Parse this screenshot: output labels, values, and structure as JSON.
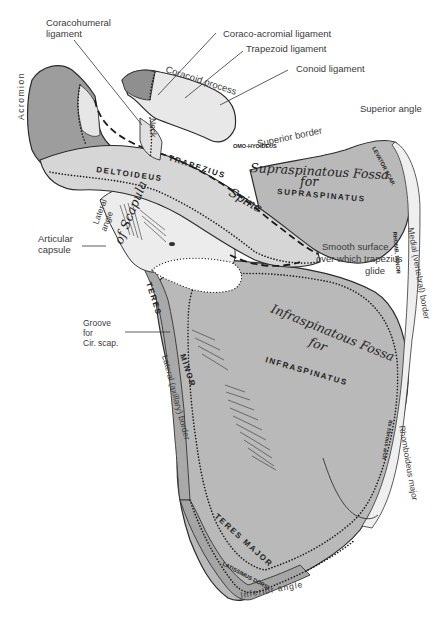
{
  "figure": {
    "colors": {
      "background": "#ffffff",
      "fossa_fill": "#b9b9b9",
      "spine_fill": "#d6d6d6",
      "bone_light": "#ececec",
      "acromion_fill": "#9d9d9d",
      "ink": "#222222"
    }
  },
  "labels": {
    "coracohumeral_ligament_line1": "Coracohumeral",
    "coracohumeral_ligament_line2": "ligament",
    "coraco_acromial_ligament": "Coraco-acromial ligament",
    "trapezoid_ligament": "Trapezoid ligament",
    "conoid_ligament": "Conoid ligament",
    "coracoid_process": "Coracoid process",
    "neck": "Neck",
    "acromion": "Acromion",
    "superior_angle": "Superior angle",
    "superior_border": "Superior border",
    "omo_hyoideus": "OMO-HYOIDEUS",
    "supraspinatous_fossa": "Supraspinatous Fossa",
    "supra_for": "for",
    "supraspinatus": "SUPRASPINATUS",
    "trapezius": "TRAPEZIUS",
    "deltoideus": "DELTOIDEUS",
    "spine": "Spine",
    "levator_scap": "LEVATOR SCAP.",
    "rhomboideus_minor": "RHOMB. MINOR",
    "lateral_angle_line1": "Lateral",
    "lateral_angle_line2": "angle",
    "of_scapula": "of Scapula",
    "articular_capsule_line1": "Articular",
    "articular_capsule_line2": "capsule",
    "smooth_surface_line1": "Smooth surface",
    "smooth_surface_line2": "over which trapezius",
    "smooth_surface_line3": "glide",
    "medial_border": "Medial (vertebral) border",
    "groove_line1": "Groove",
    "groove_line2": "for",
    "groove_line3": "Cir. scap.",
    "teres_minor_1": "TERES",
    "teres_minor_2": "MINOR",
    "lateral_border": "Lateral (axillary) border",
    "infraspinatous_fossa": "Infraspinatous Fossa",
    "infra_for": "for",
    "infraspinatus": "INFRASPINATUS",
    "fibrous_arch": "Its fibrous arch",
    "rhomboideus_major": "Rhomboideus major",
    "teres_major": "TERES MAJOR",
    "latissimus_dorsi": "LATISSIMUS DORSI",
    "inferior_angle": "Inferior angle"
  }
}
